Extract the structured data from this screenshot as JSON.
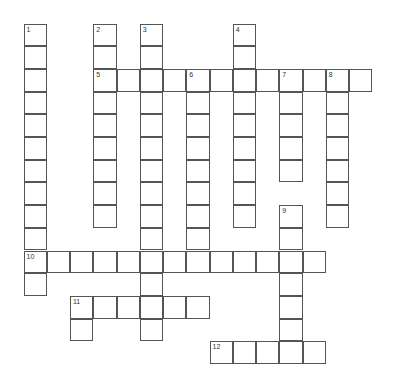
{
  "puzzle": {
    "type": "crossword",
    "entries": [
      {
        "number": "1",
        "direction": "down",
        "row": 0,
        "col": 0,
        "length": 12
      },
      {
        "number": "2",
        "direction": "down",
        "row": 0,
        "col": 3,
        "length": 9
      },
      {
        "number": "3",
        "direction": "down",
        "row": 0,
        "col": 5,
        "length": 14
      },
      {
        "number": "4",
        "direction": "down",
        "row": 0,
        "col": 9,
        "length": 9
      },
      {
        "number": "5",
        "direction": "across",
        "row": 2,
        "col": 3,
        "length": 12
      },
      {
        "number": "6",
        "direction": "down",
        "row": 2,
        "col": 7,
        "length": 9
      },
      {
        "number": "7",
        "direction": "down",
        "row": 2,
        "col": 11,
        "length": 5
      },
      {
        "number": "8",
        "direction": "down",
        "row": 2,
        "col": 13,
        "length": 7
      },
      {
        "number": "9",
        "direction": "down",
        "row": 8,
        "col": 11,
        "length": 7
      },
      {
        "number": "10",
        "direction": "across",
        "row": 10,
        "col": 0,
        "length": 13
      },
      {
        "number": "11",
        "direction": "across",
        "row": 12,
        "col": 2,
        "length": 6
      },
      {
        "number": "11d",
        "label": "",
        "direction": "down",
        "row": 12,
        "col": 2,
        "length": 2
      },
      {
        "number": "12",
        "direction": "across",
        "row": 14,
        "col": 8,
        "length": 5
      }
    ]
  }
}
